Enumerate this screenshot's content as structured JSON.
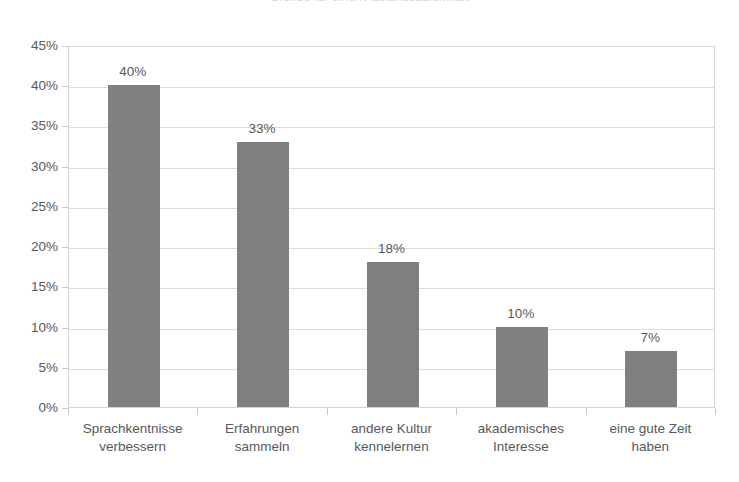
{
  "chart_data": {
    "type": "bar",
    "title": "Gründe für einen Auslandsaufenthalt",
    "xlabel": "",
    "ylabel": "",
    "ylim": [
      0,
      45
    ],
    "ytick_labels": [
      "45%",
      "40%",
      "35%",
      "30%",
      "25%",
      "20%",
      "15%",
      "10%",
      "5%",
      "0%"
    ],
    "ytick_values": [
      45,
      40,
      35,
      30,
      25,
      20,
      15,
      10,
      5,
      0
    ],
    "grid": true,
    "legend": false,
    "value_label_format": "percent",
    "bar_color": "#808080",
    "text_color": "#595959",
    "gridline_color": "#dcdcdc",
    "background_color": "#ffffff",
    "categories": [
      "Sprachkentnisse verbessern",
      "Erfahrungen sammeln",
      "andere Kultur kennelernen",
      "akademisches Interesse",
      "eine gute Zeit haben"
    ],
    "category_lines": [
      [
        "Sprachkentnisse",
        "verbessern"
      ],
      [
        "Erfahrungen",
        "sammeln"
      ],
      [
        "andere Kultur",
        "kennelernen"
      ],
      [
        "akademisches",
        "Interesse"
      ],
      [
        "eine gute Zeit",
        "haben"
      ]
    ],
    "values": [
      40,
      33,
      18,
      10,
      7
    ],
    "value_labels": [
      "40%",
      "33%",
      "18%",
      "10%",
      "7%"
    ]
  }
}
